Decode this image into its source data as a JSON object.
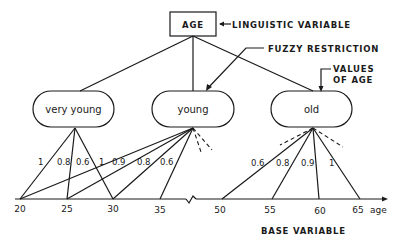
{
  "root": {
    "label": "AGE",
    "annotation": "LINGUISTIC VARIABLE"
  },
  "annotations": {
    "fuzzy_restriction": "FUZZY RESTRICTION",
    "values_of_age_line1": "VALUES",
    "values_of_age_line2": "OF AGE",
    "base_variable": "BASE VARIABLE",
    "axis_unit": "age"
  },
  "nodes": [
    {
      "label": "very young"
    },
    {
      "label": "young"
    },
    {
      "label": "old"
    }
  ],
  "grades": {
    "very_young": [
      "1",
      "0.8",
      "0.6"
    ],
    "young": [
      "1",
      "0.9",
      "0.8",
      "0.6"
    ],
    "old": [
      "0.6",
      "0.8",
      "0.9",
      "1"
    ]
  },
  "axis": {
    "ticks": [
      "20",
      "25",
      "30",
      "35",
      "50",
      "55",
      "60",
      "65"
    ]
  },
  "colors": {
    "ink": "#1a1a1a",
    "background": "#ffffff"
  }
}
